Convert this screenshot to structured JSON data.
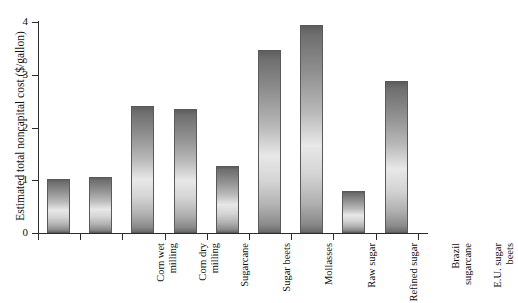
{
  "chart_data": {
    "type": "bar",
    "title": "",
    "xlabel": "",
    "ylabel": "Estimated total noncapital cost  ($/gallon)",
    "ylim": [
      0,
      4
    ],
    "yticks": [
      0,
      1,
      2,
      3,
      4
    ],
    "ytick_labels": [
      "0",
      "1",
      "2",
      "3",
      "4"
    ],
    "grid": false,
    "legend": "none",
    "categories": [
      "Corn wet milling",
      "Corn dry milling",
      "Sugarcane",
      "Sugar beets",
      "Mollasses",
      "Raw sugar",
      "Refined sugar",
      "Brazil sugarcane",
      "E.U. sugar beets"
    ],
    "category_lines": [
      [
        "Corn wet",
        "milling"
      ],
      [
        "Corn dry",
        "milling"
      ],
      [
        "Sugarcane"
      ],
      [
        "Sugar beets"
      ],
      [
        "Mollasses"
      ],
      [
        "Raw sugar"
      ],
      [
        "Refined sugar"
      ],
      [
        "Brazil",
        "sugarcane"
      ],
      [
        "E.U. sugar",
        "beets"
      ]
    ],
    "values": [
      1.03,
      1.07,
      2.41,
      2.35,
      1.27,
      3.47,
      3.95,
      0.79,
      2.89
    ],
    "bar_fill": "#b9b9b9",
    "bar_edge": "#5a5a5a",
    "axis_color": "#2b2b2b",
    "background": "#ffffff"
  }
}
